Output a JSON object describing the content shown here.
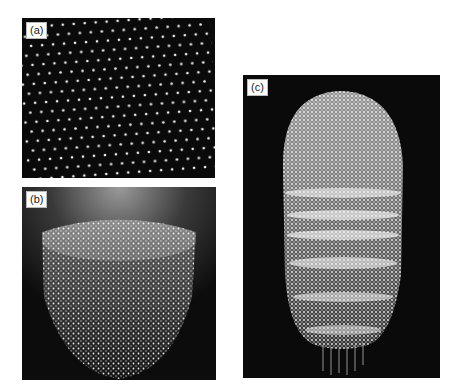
{
  "figure": {
    "panels": [
      {
        "id": "a",
        "label": "(a)",
        "description": "flat hexagonal lattice of bright points on black background"
      },
      {
        "id": "b",
        "label": "(b)",
        "description": "dome-shaped cluster of bright points, side view"
      },
      {
        "id": "c",
        "label": "(c)",
        "description": "elongated capsule-shaped cluster of bright points with horizontal banded layers"
      }
    ],
    "colors": {
      "background": "#ffffff",
      "panel_background": "#0c0c0c",
      "points": "#f2f2f2"
    }
  }
}
